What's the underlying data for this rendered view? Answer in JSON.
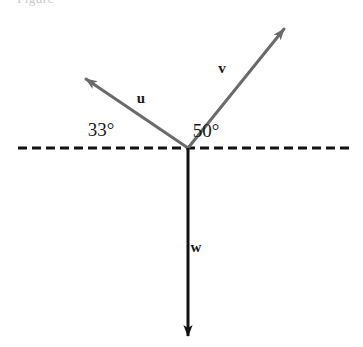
{
  "figure": {
    "background_color": "#ffffff",
    "width": 363,
    "height": 347,
    "caption_sliver": "Figure"
  },
  "colors": {
    "vector_gray": "#6a6a6a",
    "vector_black": "#111111",
    "dashed_line": "#111111",
    "text": "#1a1a1a"
  },
  "origin": {
    "x": 188,
    "y": 148
  },
  "dashed_axis": {
    "name": "horizontal reference line",
    "x1": 18,
    "x2": 352,
    "y": 148,
    "style": "dashed",
    "dash": "9 5",
    "width": 3
  },
  "vectors": [
    {
      "id": "u",
      "label": "u",
      "label_x": 141,
      "label_y": 103,
      "tip_x": 86,
      "tip_y": 79,
      "angle_deg": 33,
      "angle_direction": "above horizontal, to the left",
      "color": "#6a6a6a",
      "stroke_width": 3
    },
    {
      "id": "v",
      "label": "v",
      "label_x": 222,
      "label_y": 73,
      "tip_x": 284,
      "tip_y": 29,
      "angle_deg": 50,
      "angle_direction": "above horizontal, to the right",
      "color": "#6a6a6a",
      "stroke_width": 3
    },
    {
      "id": "w",
      "label": "w",
      "label_x": 196,
      "label_y": 252,
      "tip_x": 188,
      "tip_y": 336,
      "angle_deg": 270,
      "angle_direction": "straight down",
      "color": "#111111",
      "stroke_width": 3
    }
  ],
  "angle_labels": [
    {
      "id": "angle-u",
      "text": "33°",
      "value": 33,
      "unit": "degrees",
      "x": 101,
      "y": 136,
      "between": "dashed line and vector u"
    },
    {
      "id": "angle-v",
      "text": "50°",
      "value": 50,
      "unit": "degrees",
      "x": 206,
      "y": 137,
      "between": "dashed line and vector v"
    }
  ]
}
